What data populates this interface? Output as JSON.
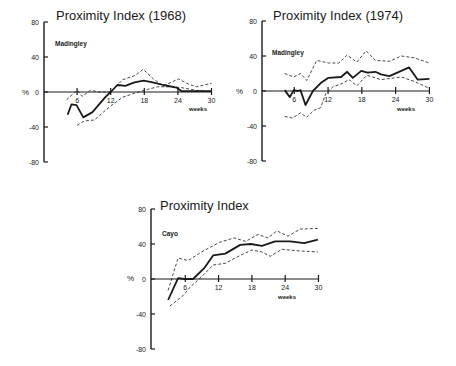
{
  "figure": {
    "panels": [
      {
        "id": "panel-1968",
        "title": "Proximity Index (1968)",
        "site": "Madingley"
      },
      {
        "id": "panel-1974",
        "title": "Proximity Index (1974)",
        "site": "Madingley"
      },
      {
        "id": "panel-cayo",
        "title": "Proximity Index",
        "site": "Cayo"
      }
    ]
  },
  "chart_data": [
    {
      "type": "line",
      "title": "Proximity Index (1968)",
      "annotation": "Madingley",
      "xlabel": "weeks",
      "ylabel": "%",
      "xticks": [
        6,
        12,
        18,
        24,
        30
      ],
      "yticks": [
        80,
        40,
        0,
        -40,
        -80
      ],
      "xlim": [
        0,
        30
      ],
      "ylim": [
        -80,
        80
      ],
      "grid": false,
      "series": [
        {
          "name": "mean",
          "style": "solid",
          "x": [
            4.3,
            5.0,
            5.9,
            7.1,
            8.75,
            11.0,
            12.0,
            13.2,
            14.6,
            16.25,
            17.9,
            19.5,
            21.4,
            23.75,
            24.6,
            30.0
          ],
          "y": [
            -26,
            -14,
            -15,
            -29,
            -23,
            -6,
            0,
            8,
            7,
            11,
            13,
            11,
            8,
            5,
            1,
            1
          ]
        },
        {
          "name": "upper",
          "style": "dashed",
          "x": [
            4.1,
            6.0,
            6.9,
            8.4,
            10.0,
            12.0,
            14.1,
            16.4,
            17.8,
            19.6,
            21.4,
            24.1,
            25.9,
            27.3,
            30.0
          ],
          "y": [
            -9,
            2,
            -5,
            2,
            0,
            0,
            14,
            19,
            26,
            15,
            7,
            15,
            9,
            6,
            10
          ]
        },
        {
          "name": "lower",
          "style": "dashed",
          "x": [
            6.0,
            7.3,
            9.1,
            10.7,
            12.0,
            14.1,
            16.4,
            18.6,
            20.4,
            22.7,
            24.6,
            27.3,
            30.0
          ],
          "y": [
            -38,
            -33,
            -32,
            -23,
            -16,
            -6,
            -1,
            3,
            6,
            6,
            5,
            2,
            0
          ]
        }
      ]
    },
    {
      "type": "line",
      "title": "Proximity Index (1974)",
      "annotation": "Madingley",
      "xlabel": "weeks",
      "ylabel": "%",
      "xticks": [
        6,
        12,
        18,
        24,
        30
      ],
      "yticks": [
        80,
        40,
        0,
        -40,
        -80
      ],
      "xlim": [
        0,
        30
      ],
      "ylim": [
        -80,
        80
      ],
      "grid": false,
      "series": [
        {
          "name": "mean",
          "style": "solid",
          "x": [
            4.3,
            5.2,
            5.9,
            6.6,
            7.1,
            8.0,
            9.3,
            10.7,
            12.0,
            14.3,
            15.4,
            16.4,
            17.9,
            19.0,
            20.4,
            21.4,
            22.9,
            25.0,
            26.4,
            27.9,
            30.0
          ],
          "y": [
            1,
            -7,
            1,
            0,
            1,
            -16,
            0,
            9,
            15,
            16,
            22,
            15,
            23,
            21,
            22,
            19,
            17,
            23,
            27,
            13,
            14
          ]
        },
        {
          "name": "upper",
          "style": "dashed",
          "x": [
            4.3,
            5.9,
            7.1,
            8.2,
            10.0,
            12.1,
            13.9,
            15.4,
            17.1,
            18.75,
            20.4,
            22.9,
            25.0,
            27.3,
            30.0
          ],
          "y": [
            20,
            16,
            20,
            12,
            35,
            32,
            32,
            41,
            33,
            46,
            35,
            34,
            40,
            38,
            32
          ]
        },
        {
          "name": "lower",
          "style": "dashed",
          "x": [
            4.3,
            5.7,
            7.1,
            8.2,
            9.5,
            10.7,
            11.6,
            12.9,
            14.3,
            15.7,
            17.1,
            18.9,
            21.4,
            25.0,
            27.3,
            30.0
          ],
          "y": [
            -29,
            -31,
            -25,
            -30,
            -22,
            -19,
            -3,
            5,
            8,
            13,
            6,
            18,
            13,
            16,
            11,
            3
          ]
        }
      ]
    },
    {
      "type": "line",
      "title": "Proximity Index",
      "annotation": "Cayo",
      "xlabel": "weeks",
      "ylabel": "%",
      "xticks": [
        6,
        12,
        18,
        24,
        30
      ],
      "yticks": [
        80,
        40,
        0,
        -40,
        -80
      ],
      "xlim": [
        0,
        30
      ],
      "ylim": [
        -80,
        80
      ],
      "grid": false,
      "series": [
        {
          "name": "mean",
          "style": "solid",
          "x": [
            2.9,
            4.7,
            5.8,
            6.3,
            7.4,
            9.5,
            11.0,
            13.2,
            15.9,
            17.8,
            19.8,
            22.2,
            24.9,
            27.4,
            29.9
          ],
          "y": [
            -24,
            1,
            0,
            0,
            0,
            13,
            27,
            29,
            39,
            40,
            38,
            43,
            43,
            41,
            45
          ]
        },
        {
          "name": "upper",
          "style": "dashed",
          "x": [
            2.9,
            4.7,
            6.5,
            9.2,
            12.2,
            14.8,
            16.9,
            19.1,
            20.9,
            22.5,
            24.5,
            26.7,
            29.9
          ],
          "y": [
            -13,
            24,
            21,
            32,
            42,
            47,
            43,
            51,
            47,
            55,
            49,
            57,
            58
          ]
        },
        {
          "name": "lower",
          "style": "dashed",
          "x": [
            3.2,
            5.6,
            6.9,
            9.0,
            11.0,
            13.2,
            15.9,
            18.0,
            19.8,
            21.3,
            23.4,
            26.7,
            29.9
          ],
          "y": [
            -31,
            -19,
            -9,
            3,
            16,
            18,
            27,
            33,
            31,
            26,
            34,
            32,
            31
          ]
        }
      ]
    }
  ]
}
